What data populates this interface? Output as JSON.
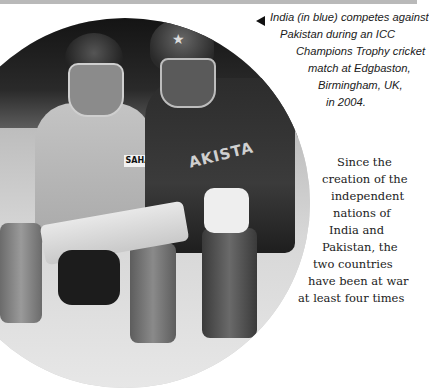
{
  "photo": {
    "description": "India (blue) wicketkeeper and Pakistan batsman at ICC Champions Trophy match",
    "keeper_sponsor_text": "SAHA",
    "batsman_shirt_text": "AKISTA",
    "helmet_star": "★"
  },
  "caption": {
    "arrow_icon": "left-triangle",
    "lines": [
      "India (in blue) competes against",
      "Pakistan during an ICC",
      "Champions Trophy cricket",
      "match at Edgbaston,",
      "Birmingham, UK,",
      "in 2004."
    ]
  },
  "body": {
    "lines": [
      "Since the",
      "creation of the",
      "independent",
      "nations of",
      "India and",
      "Pakistan, the",
      "two countries",
      "have been at war",
      "at least four times"
    ]
  }
}
